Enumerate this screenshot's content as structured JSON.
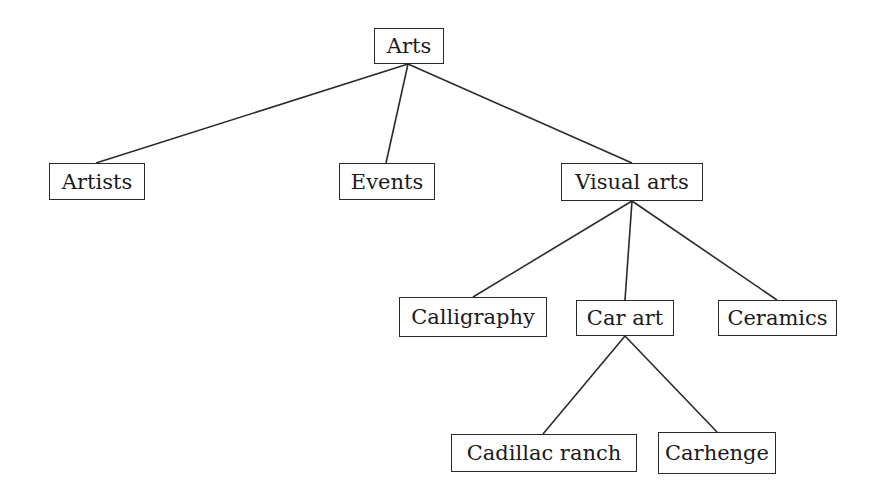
{
  "diagram": {
    "type": "tree",
    "line_color": "#2a2a2a",
    "nodes": [
      {
        "id": "arts",
        "label": "Arts",
        "x": 374,
        "y": 28,
        "w": 70,
        "h": 36
      },
      {
        "id": "artists",
        "label": "Artists",
        "x": 49,
        "y": 163,
        "w": 96,
        "h": 37
      },
      {
        "id": "events",
        "label": "Events",
        "x": 339,
        "y": 163,
        "w": 96,
        "h": 37
      },
      {
        "id": "visual_arts",
        "label": "Visual arts",
        "x": 561,
        "y": 163,
        "w": 142,
        "h": 38
      },
      {
        "id": "calligraphy",
        "label": "Calligraphy",
        "x": 399,
        "y": 297,
        "w": 148,
        "h": 40
      },
      {
        "id": "car_art",
        "label": "Car art",
        "x": 576,
        "y": 300,
        "w": 98,
        "h": 36
      },
      {
        "id": "ceramics",
        "label": "Ceramics",
        "x": 718,
        "y": 300,
        "w": 119,
        "h": 36
      },
      {
        "id": "cadillac_ranch",
        "label": "Cadillac ranch",
        "x": 451,
        "y": 434,
        "w": 186,
        "h": 38
      },
      {
        "id": "carhenge",
        "label": "Carhenge",
        "x": 658,
        "y": 432,
        "w": 118,
        "h": 42
      }
    ],
    "edges": [
      {
        "from": "arts",
        "to": "artists",
        "x1": 408,
        "y1": 64,
        "x2": 96,
        "y2": 163
      },
      {
        "from": "arts",
        "to": "events",
        "x1": 408,
        "y1": 64,
        "x2": 386,
        "y2": 163
      },
      {
        "from": "arts",
        "to": "visual_arts",
        "x1": 408,
        "y1": 64,
        "x2": 632,
        "y2": 163
      },
      {
        "from": "visual_arts",
        "to": "calligraphy",
        "x1": 632,
        "y1": 201,
        "x2": 473,
        "y2": 297
      },
      {
        "from": "visual_arts",
        "to": "car_art",
        "x1": 632,
        "y1": 201,
        "x2": 625,
        "y2": 300
      },
      {
        "from": "visual_arts",
        "to": "ceramics",
        "x1": 632,
        "y1": 201,
        "x2": 777,
        "y2": 300
      },
      {
        "from": "car_art",
        "to": "cadillac_ranch",
        "x1": 625,
        "y1": 336,
        "x2": 543,
        "y2": 434
      },
      {
        "from": "car_art",
        "to": "carhenge",
        "x1": 625,
        "y1": 336,
        "x2": 717,
        "y2": 432
      }
    ]
  }
}
